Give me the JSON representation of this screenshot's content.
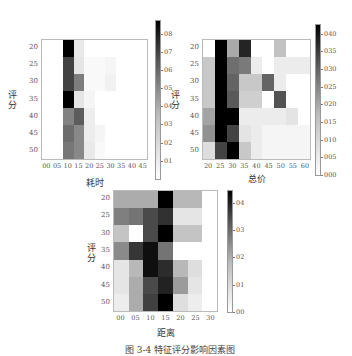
{
  "caption": "图 3-4  特征评分影响因素图",
  "chart_data": [
    {
      "type": "heatmap",
      "title": "",
      "xlabel": "耗时",
      "ylabel": "评分",
      "x_ticks": [
        "00",
        "05",
        "10",
        "15",
        "20",
        "25",
        "30",
        "35",
        "40",
        "45"
      ],
      "y_ticks": [
        "20",
        "25",
        "30",
        "35",
        "40",
        "45",
        "50"
      ],
      "colorbar_ticks": [
        "01",
        "02",
        "03",
        "04",
        "05",
        "06",
        "07",
        "08"
      ],
      "colorbar_range": [
        0,
        0.88
      ],
      "values": [
        [
          0.0,
          0.0,
          0.88,
          0.05,
          0.0,
          0.0,
          0.0,
          0.0,
          0.0,
          0.0
        ],
        [
          0.0,
          0.0,
          0.62,
          0.06,
          0.01,
          0.01,
          0.02,
          0.0,
          0.0,
          0.0
        ],
        [
          0.0,
          0.0,
          0.62,
          0.4,
          0.01,
          0.01,
          0.03,
          0.0,
          0.0,
          0.0
        ],
        [
          0.0,
          0.0,
          0.88,
          0.06,
          0.02,
          0.0,
          0.0,
          0.0,
          0.0,
          0.0
        ],
        [
          0.0,
          0.0,
          0.38,
          0.52,
          0.04,
          0.0,
          0.0,
          0.0,
          0.0,
          0.0
        ],
        [
          0.0,
          0.0,
          0.46,
          0.36,
          0.04,
          0.02,
          0.0,
          0.0,
          0.0,
          0.0
        ],
        [
          0.0,
          0.0,
          0.42,
          0.36,
          0.05,
          0.01,
          0.0,
          0.0,
          0.0,
          0.0
        ]
      ]
    },
    {
      "type": "heatmap",
      "title": "",
      "xlabel": "总价",
      "ylabel": "评分",
      "x_ticks": [
        "20",
        "25",
        "30",
        "35",
        "40",
        "45",
        "50",
        "55",
        "60"
      ],
      "y_ticks": [
        "20",
        "25",
        "30",
        "35",
        "40",
        "45",
        "50"
      ],
      "colorbar_ticks": [
        "000",
        "005",
        "010",
        "015",
        "020",
        "025",
        "030",
        "035",
        "040"
      ],
      "colorbar_range": [
        0,
        0.043
      ],
      "values": [
        [
          0.0,
          0.043,
          0.012,
          0.036,
          0.0,
          0.0,
          0.008,
          0.0,
          0.0
        ],
        [
          0.007,
          0.043,
          0.022,
          0.02,
          0.002,
          0.0,
          0.002,
          0.002,
          0.002
        ],
        [
          0.007,
          0.043,
          0.024,
          0.007,
          0.007,
          0.024,
          0.002,
          0.0,
          0.0
        ],
        [
          0.007,
          0.043,
          0.026,
          0.006,
          0.006,
          0.0,
          0.027,
          0.0,
          0.0
        ],
        [
          0.013,
          0.043,
          0.043,
          0.002,
          0.002,
          0.002,
          0.002,
          0.003,
          0.0
        ],
        [
          0.016,
          0.043,
          0.03,
          0.003,
          0.002,
          0.001,
          0.001,
          0.001,
          0.001
        ],
        [
          0.004,
          0.03,
          0.043,
          0.007,
          0.002,
          0.001,
          0.001,
          0.001,
          0.001
        ]
      ]
    },
    {
      "type": "heatmap",
      "title": "",
      "xlabel": "距离",
      "ylabel": "评分",
      "x_ticks": [
        "00",
        "05",
        "10",
        "15",
        "20",
        "25",
        "30"
      ],
      "y_ticks": [
        "20",
        "25",
        "30",
        "35",
        "40",
        "45",
        "50"
      ],
      "colorbar_ticks": [
        "00",
        "01",
        "02",
        "03",
        "04"
      ],
      "colorbar_range": [
        0,
        0.45
      ],
      "values": [
        [
          0.12,
          0.12,
          0.12,
          0.45,
          0.1,
          0.1,
          0.0
        ],
        [
          0.2,
          0.22,
          0.3,
          0.35,
          0.03,
          0.03,
          0.0
        ],
        [
          0.08,
          0.0,
          0.3,
          0.45,
          0.08,
          0.08,
          0.0
        ],
        [
          0.18,
          0.34,
          0.42,
          0.22,
          0.0,
          0.0,
          0.0
        ],
        [
          0.03,
          0.1,
          0.42,
          0.36,
          0.1,
          0.04,
          0.0
        ],
        [
          0.03,
          0.12,
          0.3,
          0.38,
          0.15,
          0.03,
          0.0
        ],
        [
          0.02,
          0.12,
          0.32,
          0.45,
          0.04,
          0.02,
          0.0
        ]
      ]
    }
  ]
}
